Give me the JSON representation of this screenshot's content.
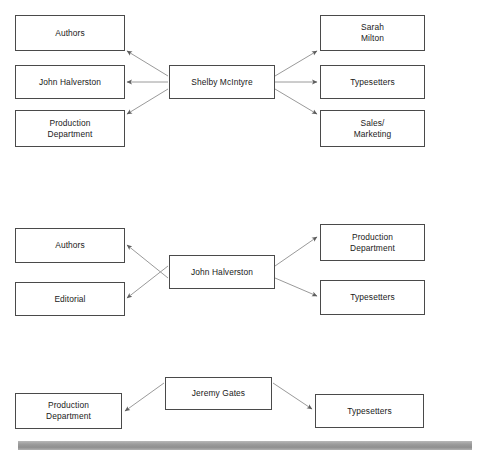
{
  "page": {
    "background_color": "#ffffff",
    "box_border_color": "#4a4a4a",
    "connector_color": "#8a8a8a",
    "footer_bar_color": "#9c9c9c"
  },
  "diagrams": [
    {
      "id": "diagram-1",
      "center": {
        "label": "Shelby McIntyre"
      },
      "left_nodes": [
        {
          "label": "Authors"
        },
        {
          "label": "John Halverston"
        },
        {
          "label": "Production\nDepartment"
        }
      ],
      "right_nodes": [
        {
          "label": "Sarah\nMilton"
        },
        {
          "label": "Typesetters"
        },
        {
          "label": "Sales/\nMarketing"
        }
      ]
    },
    {
      "id": "diagram-2",
      "center": {
        "label": "John Halverston"
      },
      "left_nodes": [
        {
          "label": "Authors"
        },
        {
          "label": "Editorial"
        }
      ],
      "right_nodes": [
        {
          "label": "Production\nDepartment"
        },
        {
          "label": "Typesetters"
        }
      ]
    },
    {
      "id": "diagram-3",
      "center": {
        "label": "Jeremy Gates"
      },
      "left_nodes": [
        {
          "label": "Production\nDepartment"
        }
      ],
      "right_nodes": [
        {
          "label": "Typesetters"
        }
      ]
    }
  ]
}
